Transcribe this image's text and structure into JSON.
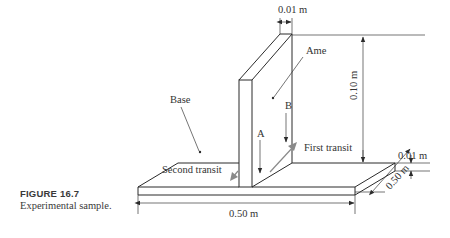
{
  "figure": {
    "caption_title": "FIGURE 16.7",
    "caption_text": "Experimental sample."
  },
  "labels": {
    "plate_thickness": "0.01 m",
    "plate_name": "Ame",
    "plate_height": "0.10 m",
    "base_name": "Base",
    "base_thickness": "0.01 m",
    "base_depth": "0.50 m",
    "base_width": "0.50 m",
    "point_a": "A",
    "point_b": "B",
    "first_transit": "First transit",
    "second_transit": "Second transit"
  },
  "colors": {
    "line": "#2b2b2b",
    "transit_arrow": "#8a8a8a",
    "text": "#333333"
  }
}
